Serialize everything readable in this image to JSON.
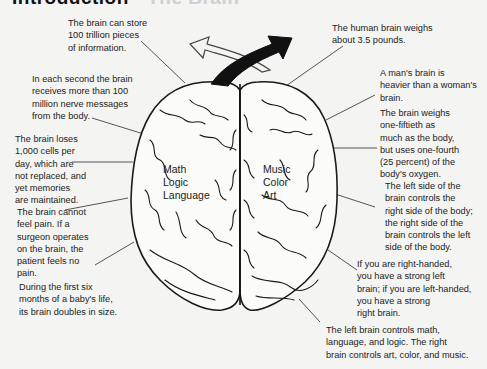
{
  "title": {
    "main": "Introduction",
    "sub": " - The Brain"
  },
  "brain": {
    "left_hemisphere_labels": [
      "Math",
      "Logic",
      "Language"
    ],
    "right_hemisphere_labels": [
      "Music",
      "Color",
      "Art"
    ]
  },
  "facts": {
    "storage": [
      "The brain can store",
      "100 trillion pieces",
      "of information."
    ],
    "messages": [
      "In each second the brain",
      "receives more than 100",
      "million nerve messages",
      "from the body."
    ],
    "cells": [
      "The brain loses",
      "1,000 cells per",
      "day, which are",
      "not replaced, and",
      "yet memories",
      "are maintained."
    ],
    "pain": [
      "The brain cannot",
      "feel pain.  If a",
      "surgeon operates",
      "on the brain, the",
      "patient feels no",
      "pain."
    ],
    "baby": [
      "During the first six",
      "months of a baby's life,",
      "its brain doubles in size."
    ],
    "weight": [
      "The human brain weighs",
      "about 3.5 pounds."
    ],
    "gender": [
      "A man's brain is",
      "heavier than a woman's",
      "brain."
    ],
    "oxygen": [
      "The brain weighs",
      "one-fiftieth as",
      "much as the body,",
      "but uses one-fourth",
      "(25 percent) of the",
      "body's oxygen."
    ],
    "control": [
      "The left side of the",
      "brain controls the",
      "right side of the body;",
      "the right side of the",
      "brain controls the left",
      "side of the body."
    ],
    "handedness": [
      "If you are right-handed,",
      "you have a strong left",
      "brain; if you are left-handed,",
      "you have a strong",
      "right brain."
    ],
    "functions": [
      "The left brain controls math,",
      "language, and logic.  The right",
      "brain controls art, color, and music."
    ]
  },
  "colors": {
    "background": "#f4f4f2",
    "ink": "#1f1f1f",
    "leader_line": "#555555"
  }
}
